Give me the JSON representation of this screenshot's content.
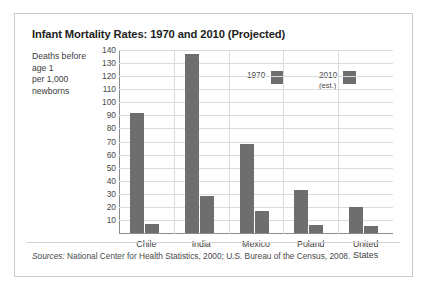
{
  "figure": {
    "title": "Infant Mortality Rates: 1970 and 2010 (Projected)",
    "axis_caption": [
      "Deaths before",
      "age 1",
      "per 1,000",
      "newborns"
    ],
    "sources_label": "Sources:",
    "sources_text": " National Center for Health Statistics, 2000; U.S. Bureau of the Census, 2008.",
    "colors": {
      "bar": "#6e6e6e",
      "grid": "#dcdcdc",
      "axis": "#8c8c8c",
      "frame": "#c9c9c9",
      "text": "#3c3c3c"
    }
  },
  "legend": {
    "entries": [
      {
        "label": "1970",
        "sublabel": "",
        "color": "#6e6e6e"
      },
      {
        "label": "2010",
        "sublabel": "(est.)",
        "color": "#6e6e6e"
      }
    ]
  },
  "chart_data": {
    "type": "bar",
    "title": "Infant Mortality Rates: 1970 and 2010 (Projected)",
    "xlabel": "",
    "ylabel": "Deaths before age 1 per 1,000 newborns",
    "categories": [
      "Chile",
      "India",
      "Mexico",
      "Poland",
      "United States"
    ],
    "category_lines": [
      [
        "Chile"
      ],
      [
        "India"
      ],
      [
        "Mexico"
      ],
      [
        "Poland"
      ],
      [
        "United",
        "States"
      ]
    ],
    "series": [
      {
        "name": "1970",
        "values": [
          92,
          137,
          68,
          33,
          20
        ]
      },
      {
        "name": "2010 (est.)",
        "values": [
          7,
          28,
          17,
          6,
          5
        ]
      }
    ],
    "ylim": [
      0,
      140
    ],
    "yticks": [
      10,
      20,
      30,
      40,
      50,
      60,
      70,
      80,
      90,
      100,
      110,
      120,
      130,
      140
    ],
    "ytick_labels": [
      "10",
      "20",
      "30",
      "40",
      "50",
      "60",
      "70",
      "80",
      "90",
      "100",
      "110",
      "120",
      "130",
      "140"
    ],
    "grid": true,
    "legend_position": "upper-center"
  }
}
